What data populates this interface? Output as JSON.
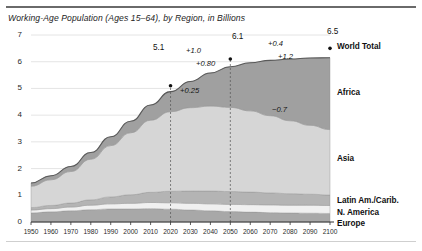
{
  "figure": {
    "title": "Working-Age Population (Ages 15–64), by Region, in Billions"
  },
  "chart_data": {
    "type": "area",
    "stacked": true,
    "title": "Working-Age Population (Ages 15–64), by Region, in Billions",
    "xlabel": "",
    "ylabel": "",
    "xlim": [
      1950,
      2100
    ],
    "ylim": [
      0,
      7
    ],
    "grid": true,
    "legend_position": "right-labels",
    "x": [
      1950,
      1960,
      1970,
      1980,
      1990,
      2000,
      2010,
      2020,
      2030,
      2040,
      2050,
      2060,
      2070,
      2080,
      2090,
      2100
    ],
    "xticks": [
      "1950",
      "1960",
      "1970",
      "1980",
      "1990",
      "2000",
      "2010",
      "2020",
      "2030",
      "2040",
      "2050",
      "2060",
      "2070",
      "2080",
      "2090",
      "2100"
    ],
    "yticks": [
      "0",
      "1",
      "2",
      "3",
      "4",
      "5",
      "6",
      "7"
    ],
    "series": [
      {
        "name": "Europe",
        "color": "#a8a8a8",
        "values": [
          0.34,
          0.38,
          0.42,
          0.46,
          0.49,
          0.49,
          0.5,
          0.48,
          0.45,
          0.42,
          0.39,
          0.37,
          0.35,
          0.34,
          0.33,
          0.32
        ]
      },
      {
        "name": "N. America",
        "color": "#f0f0f0",
        "values": [
          0.11,
          0.12,
          0.14,
          0.17,
          0.19,
          0.21,
          0.23,
          0.24,
          0.25,
          0.26,
          0.27,
          0.28,
          0.29,
          0.29,
          0.3,
          0.3
        ]
      },
      {
        "name": "Latin Am./Carib.",
        "color": "#b4b4b4",
        "values": [
          0.09,
          0.12,
          0.15,
          0.2,
          0.26,
          0.32,
          0.38,
          0.43,
          0.46,
          0.48,
          0.48,
          0.47,
          0.45,
          0.43,
          0.41,
          0.39
        ]
      },
      {
        "name": "Asia",
        "color": "#d6d6d6",
        "values": [
          0.8,
          0.96,
          1.18,
          1.52,
          1.92,
          2.32,
          2.7,
          2.98,
          3.12,
          3.18,
          3.15,
          3.04,
          2.89,
          2.73,
          2.58,
          2.45
        ]
      },
      {
        "name": "Africa",
        "color": "#a0a0a0",
        "values": [
          0.12,
          0.15,
          0.19,
          0.25,
          0.33,
          0.43,
          0.57,
          0.75,
          0.98,
          1.24,
          1.52,
          1.8,
          2.07,
          2.31,
          2.52,
          2.69
        ]
      }
    ],
    "world_total": {
      "name": "World Total",
      "values": [
        1.46,
        1.73,
        2.08,
        2.6,
        3.19,
        3.77,
        4.38,
        4.88,
        5.26,
        5.58,
        5.81,
        5.96,
        6.05,
        6.1,
        6.14,
        6.15
      ]
    },
    "markers": [
      {
        "label": "5.1",
        "year": 2020,
        "value": 5.1
      },
      {
        "label": "6.1",
        "year": 2050,
        "value": 6.1
      },
      {
        "label": "6.5",
        "year": 2100,
        "value": 6.5
      }
    ],
    "reference_lines": [
      {
        "year": 2020,
        "style": "dashed"
      },
      {
        "year": 2050,
        "style": "dashed"
      }
    ],
    "annotations": [
      {
        "text": "+1.0",
        "series": "World Total",
        "period": "2020–2050"
      },
      {
        "text": "+0.4",
        "series": "World Total",
        "period": "2050–2100"
      },
      {
        "text": "+0.80",
        "series": "Africa",
        "period": "2020–2050"
      },
      {
        "text": "+1.2",
        "series": "Africa",
        "period": "2050–2100"
      },
      {
        "text": "+0.25",
        "series": "Asia",
        "period": "2020–2050"
      },
      {
        "text": "−0.7",
        "series": "Asia",
        "period": "2050–2100"
      }
    ],
    "region_labels": [
      {
        "name": "World Total"
      },
      {
        "name": "Africa"
      },
      {
        "name": "Asia"
      },
      {
        "name": "Latin Am./Carib."
      },
      {
        "name": "N. America"
      },
      {
        "name": "Europe"
      }
    ]
  }
}
